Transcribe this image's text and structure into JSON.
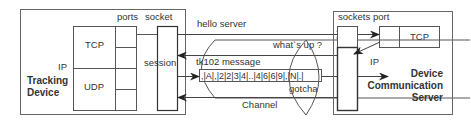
{
  "left": {
    "title_line1": "Tracking",
    "title_line2": "Device",
    "ip_label": "IP",
    "ports_label": "ports",
    "socket_label": "socket",
    "tcp_label": "TCP",
    "udp_label": "UDP",
    "session_label": "session"
  },
  "right": {
    "title_line1": "Device",
    "title_line2": "Communication",
    "title_line3": "Server",
    "sockets_label": "sockets",
    "port_label": "port",
    "tcp_label": "TCP",
    "ip_label": "IP"
  },
  "channel": {
    "label": "Channel",
    "hello": "hello server",
    "whatsup": "what`s up ?",
    "message_title": "tk102 message",
    "message_content": ",|A|,|2|2|3|4|..|4|6|6|9|,|N|.|",
    "gotcha": "gotcha"
  },
  "colors": {
    "stroke": "#444444",
    "text": "#333333",
    "background": "#ffffff"
  }
}
